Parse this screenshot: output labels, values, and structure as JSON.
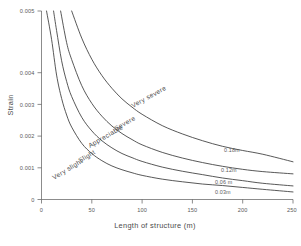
{
  "chart_data": {
    "type": "line",
    "title": "",
    "subtitle": "",
    "xlabel": "Length of structure  (m)",
    "ylabel": "Strain",
    "xlim": [
      0,
      250
    ],
    "ylim": [
      0,
      0.005
    ],
    "grid": false,
    "legend_position": "inline-right-end",
    "x_ticks": [
      "0",
      "50",
      "100",
      "150",
      "200",
      "250"
    ],
    "x_tick_values": [
      0,
      50,
      100,
      150,
      200,
      250
    ],
    "y_ticks": [
      "0",
      "0.001",
      "0.002",
      "0.003",
      "0.004",
      "0.005"
    ],
    "y_tick_values": [
      0,
      0.001,
      0.002,
      0.003,
      0.004,
      0.005
    ],
    "series": [
      {
        "name": "0.03m",
        "end_label": "0.03m",
        "x": [
          5,
          10,
          15,
          20,
          25,
          30,
          40,
          50,
          60,
          70,
          80,
          90,
          100,
          120,
          140,
          160,
          180,
          200,
          220,
          250
        ],
        "values": [
          0.005,
          0.00425,
          0.0033,
          0.00268,
          0.00224,
          0.00192,
          0.00149,
          0.00122,
          0.00103,
          0.00089,
          0.00079,
          0.00071,
          0.00064,
          0.00054,
          0.00047,
          0.00041,
          0.00037,
          0.00032,
          0.00027,
          0.0002
        ]
      },
      {
        "name": "0.06m",
        "end_label": "0.06 m",
        "x": [
          12,
          15,
          20,
          25,
          30,
          40,
          50,
          60,
          70,
          80,
          90,
          100,
          120,
          140,
          160,
          180,
          200,
          220,
          250
        ],
        "values": [
          0.005,
          0.00448,
          0.00368,
          0.00313,
          0.00273,
          0.00218,
          0.00182,
          0.00156,
          0.00137,
          0.00122,
          0.00111,
          0.00101,
          0.00086,
          0.00075,
          0.00066,
          0.00057,
          0.0005,
          0.00043,
          0.00036
        ]
      },
      {
        "name": "0.12m",
        "end_label": "0.12m",
        "x": [
          19,
          25,
          30,
          40,
          50,
          60,
          70,
          80,
          90,
          100,
          120,
          140,
          160,
          180,
          200,
          220,
          250
        ],
        "values": [
          0.005,
          0.00416,
          0.00371,
          0.00302,
          0.00255,
          0.00221,
          0.00195,
          0.00175,
          0.00159,
          0.00145,
          0.00125,
          0.0011,
          0.00098,
          0.00088,
          0.0008,
          0.00074,
          0.00068
        ]
      },
      {
        "name": "0.18m",
        "end_label": "0.18m",
        "x": [
          30,
          40,
          50,
          60,
          70,
          80,
          90,
          100,
          120,
          140,
          160,
          180,
          200,
          220,
          250
        ],
        "values": [
          0.005,
          0.00428,
          0.00372,
          0.00329,
          0.00295,
          0.00267,
          0.00245,
          0.00226,
          0.00196,
          0.00174,
          0.00156,
          0.00141,
          0.0013,
          0.0012,
          0.001
        ]
      }
    ],
    "curve_labels": [
      {
        "text": "Very severe",
        "x": 0.0,
        "y": 0.0
      },
      {
        "text": "Severe",
        "x": 0.0,
        "y": 0.0
      },
      {
        "text": "Appreciable",
        "x": 0.0,
        "y": 0.0
      },
      {
        "text": "Slight",
        "x": 0.0,
        "y": 0.0
      },
      {
        "text": "Very slight",
        "x": 0.0,
        "y": 0.0
      }
    ]
  },
  "axes": {
    "y_title": "Strain",
    "x_title": "Length of structure  (m)",
    "y_tick_0": "0",
    "y_tick_1": "0.001",
    "y_tick_2": "0.002",
    "y_tick_3": "0.003",
    "y_tick_4": "0.004",
    "y_tick_5": "0.005",
    "x_tick_0": "0",
    "x_tick_1": "50",
    "x_tick_2": "100",
    "x_tick_3": "150",
    "x_tick_4": "200",
    "x_tick_5": "250"
  },
  "band_labels": {
    "very_severe": "Very severe",
    "severe": "Severe",
    "appreciable": "Appreciable",
    "slight": "Slight",
    "very_slight": "Very slight"
  },
  "end_labels": {
    "c018": "0.18m",
    "c012": "0.12m",
    "c006": "0.06 m",
    "c003": "0.03m"
  },
  "colors": {
    "curve": "#3a3a3a",
    "axis": "#5a5a5a",
    "text": "#4a4a4a",
    "background": "#ffffff"
  }
}
